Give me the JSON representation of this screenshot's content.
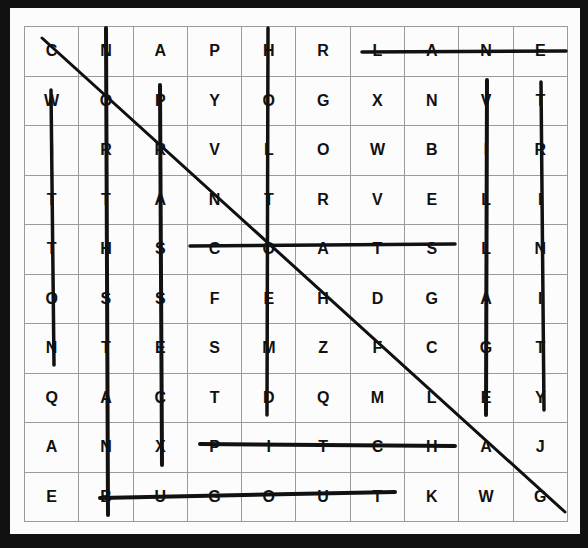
{
  "puzzle": {
    "grid": [
      [
        "C",
        "N",
        "A",
        "P",
        "H",
        "R",
        "L",
        "A",
        "N",
        "E"
      ],
      [
        "W",
        "O",
        "P",
        "Y",
        "O",
        "G",
        "X",
        "N",
        "V",
        "T"
      ],
      [
        "I",
        "R",
        "R",
        "V",
        "L",
        "O",
        "W",
        "B",
        "I",
        "R"
      ],
      [
        "T",
        "T",
        "A",
        "N",
        "T",
        "R",
        "V",
        "E",
        "L",
        "I"
      ],
      [
        "T",
        "H",
        "S",
        "C",
        "O",
        "A",
        "T",
        "S",
        "L",
        "N"
      ],
      [
        "O",
        "S",
        "S",
        "F",
        "E",
        "H",
        "D",
        "G",
        "A",
        "I"
      ],
      [
        "N",
        "T",
        "E",
        "S",
        "M",
        "Z",
        "F",
        "C",
        "G",
        "T"
      ],
      [
        "Q",
        "A",
        "C",
        "T",
        "D",
        "Q",
        "M",
        "L",
        "E",
        "Y"
      ],
      [
        "A",
        "N",
        "X",
        "P",
        "I",
        "T",
        "C",
        "H",
        "A",
        "J"
      ],
      [
        "E",
        "B",
        "U",
        "G",
        "O",
        "U",
        "T",
        "K",
        "W",
        "G"
      ]
    ],
    "found_words": [
      "LANE",
      "PITCH",
      "BUGOUT",
      "COATS",
      "VILLAGE",
      "TRINITY"
    ]
  }
}
